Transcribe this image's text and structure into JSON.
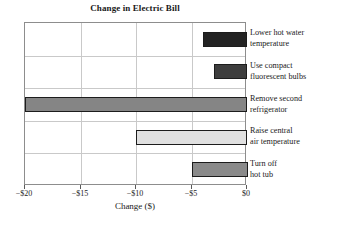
{
  "chart_data": {
    "type": "bar",
    "orientation": "horizontal",
    "title": "Change in Electric Bill",
    "xlabel": "Change ($)",
    "ylabel": "",
    "xlim": [
      -20,
      0
    ],
    "grid": true,
    "legend": false,
    "xticks": [
      -20,
      -15,
      -10,
      -5,
      0
    ],
    "xtick_labels": [
      "−$20",
      "−$15",
      "−$10",
      "−$5",
      "$0"
    ],
    "categories": [
      "Lower hot water temperature",
      "Use compact fluorescent bulbs",
      "Remove second refrigerator",
      "Raise central air temperature",
      "Turn off hot tub"
    ],
    "values": [
      -4,
      -3,
      -20,
      -10,
      -5
    ],
    "bar_colors": [
      "#232323",
      "#3d3d3d",
      "#858585",
      "#e0e0e0",
      "#8a8a8a"
    ],
    "bars": [
      {
        "label_line1": "Lower hot water",
        "label_line2": "temperature",
        "value": -4,
        "color": "#232323"
      },
      {
        "label_line1": "Use compact",
        "label_line2": "fluorescent bulbs",
        "value": -3,
        "color": "#3d3d3d"
      },
      {
        "label_line1": "Remove second",
        "label_line2": "refrigerator",
        "value": -20,
        "color": "#858585"
      },
      {
        "label_line1": "Raise central",
        "label_line2": "air temperature",
        "value": -10,
        "color": "#e0e0e0"
      },
      {
        "label_line1": "Turn off",
        "label_line2": "hot tub",
        "value": -5,
        "color": "#8a8a8a"
      }
    ]
  }
}
